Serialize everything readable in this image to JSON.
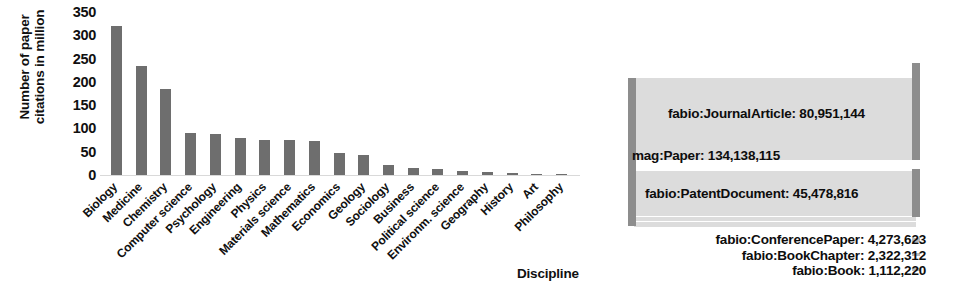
{
  "chart_data": [
    {
      "type": "bar",
      "title": "",
      "xlabel": "Discipline",
      "ylabel": "Number of paper citations in million",
      "ylim": [
        0,
        350
      ],
      "yticks": [
        0,
        50,
        100,
        150,
        200,
        250,
        300,
        350
      ],
      "grid": false,
      "bar_color": "#6e6e6e",
      "categories": [
        "Biology",
        "Medicine",
        "Chemistry",
        "Computer science",
        "Psychology",
        "Engineering",
        "Physics",
        "Materials science",
        "Mathematics",
        "Economics",
        "Geology",
        "Sociology",
        "Business",
        "Political science",
        "Environm. science",
        "Geography",
        "History",
        "Art",
        "Philosophy"
      ],
      "values": [
        320,
        235,
        185,
        90,
        89,
        79,
        76,
        75,
        73,
        48,
        42,
        22,
        14,
        12,
        9,
        6,
        4,
        3,
        2
      ]
    },
    {
      "type": "sankey",
      "title": "",
      "node_color": "#8d8d8d",
      "flow_color": "#dcdcdc",
      "source": {
        "label": "mag:Paper: 134,138,115",
        "value": 134138115
      },
      "targets": [
        {
          "label": "fabio:JournalArticle: 80,951,144",
          "value": 80951144
        },
        {
          "label": "fabio:PatentDocument: 45,478,816",
          "value": 45478816
        },
        {
          "label": "fabio:ConferencePaper: 4,273,623",
          "value": 4273623
        },
        {
          "label": "fabio:BookChapter: 2,322,312",
          "value": 2322312
        },
        {
          "label": "fabio:Book: 1,112,220",
          "value": 1112220
        }
      ]
    }
  ],
  "barchart": {
    "y_axis_title_line1": "Number of paper",
    "y_axis_title_line2": "citations in million",
    "x_axis_title": "Discipline"
  },
  "sankey": {
    "source_label": "mag:Paper: 134,138,115",
    "flow1_label": "fabio:JournalArticle: 80,951,144",
    "flow2_label": "fabio:PatentDocument: 45,478,816",
    "flow3_label": "fabio:ConferencePaper: 4,273,623",
    "flow4_label": "fabio:BookChapter: 2,322,312",
    "flow5_label": "fabio:Book: 1,112,220"
  }
}
